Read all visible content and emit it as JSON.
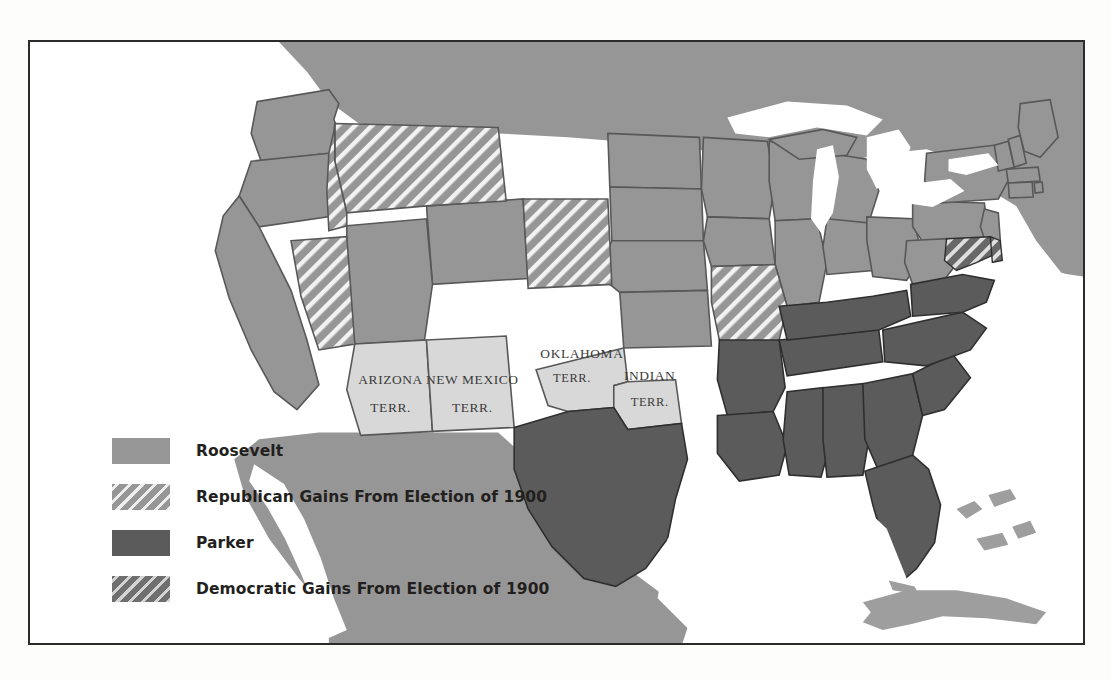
{
  "figure": {
    "kind": "historical-election-map",
    "region": "United States",
    "frame_border_color": "#2b2b2b",
    "background_color": "#ffffff"
  },
  "colors": {
    "roosevelt": "#969696",
    "parker": "#5b5b5b",
    "republican_gain_base": "#969696",
    "republican_gain_hatch": "#f5f5f5",
    "democratic_gain_base": "#6f6f6f",
    "democratic_gain_hatch": "#e1e1e1",
    "territory": "#d8d8d8",
    "water": "#ffffff",
    "outline": "#4a4a4a",
    "state_border": "#585858",
    "text": "#231f1d"
  },
  "legend": {
    "items": [
      {
        "label": "Roosevelt",
        "swatch": "roosevelt",
        "pattern": "solid"
      },
      {
        "label": "Republican Gains From Election of 1900",
        "swatch": "republican-gain",
        "pattern": "hatch"
      },
      {
        "label": "Parker",
        "swatch": "parker",
        "pattern": "solid"
      },
      {
        "label": "Democratic Gains From Election of 1900",
        "swatch": "democratic-gain",
        "pattern": "hatch"
      }
    ]
  },
  "territory_labels": [
    {
      "line1": "ARIZONA",
      "line2": "TERR."
    },
    {
      "line1": "NEW MEXICO",
      "line2": "TERR."
    },
    {
      "line1": "OKLAHOMA",
      "line2": "TERR."
    },
    {
      "line1": "INDIAN",
      "line2": "TERR."
    }
  ],
  "map_content": {
    "type": "choropleth",
    "election_year": 1904,
    "candidates": [
      "Roosevelt",
      "Parker"
    ],
    "categories": [
      "Roosevelt",
      "Republican Gains From Election of 1900",
      "Parker",
      "Democratic Gains From Election of 1900"
    ],
    "regions": [
      {
        "name": "Washington",
        "category": "Roosevelt"
      },
      {
        "name": "Oregon",
        "category": "Roosevelt"
      },
      {
        "name": "California",
        "category": "Roosevelt"
      },
      {
        "name": "Idaho",
        "category": "Republican Gains From Election of 1900"
      },
      {
        "name": "Nevada",
        "category": "Republican Gains From Election of 1900"
      },
      {
        "name": "Montana",
        "category": "Republican Gains From Election of 1900"
      },
      {
        "name": "Wyoming",
        "category": "Roosevelt"
      },
      {
        "name": "Utah",
        "category": "Roosevelt"
      },
      {
        "name": "Colorado",
        "category": "Republican Gains From Election of 1900"
      },
      {
        "name": "North Dakota",
        "category": "Roosevelt"
      },
      {
        "name": "South Dakota",
        "category": "Roosevelt"
      },
      {
        "name": "Nebraska",
        "category": "Roosevelt"
      },
      {
        "name": "Kansas",
        "category": "Roosevelt"
      },
      {
        "name": "Minnesota",
        "category": "Roosevelt"
      },
      {
        "name": "Iowa",
        "category": "Roosevelt"
      },
      {
        "name": "Missouri",
        "category": "Republican Gains From Election of 1900"
      },
      {
        "name": "Wisconsin",
        "category": "Roosevelt"
      },
      {
        "name": "Illinois",
        "category": "Roosevelt"
      },
      {
        "name": "Michigan",
        "category": "Roosevelt"
      },
      {
        "name": "Indiana",
        "category": "Roosevelt"
      },
      {
        "name": "Ohio",
        "category": "Roosevelt"
      },
      {
        "name": "Kentucky",
        "category": "Parker"
      },
      {
        "name": "Tennessee",
        "category": "Parker"
      },
      {
        "name": "Arkansas",
        "category": "Parker"
      },
      {
        "name": "Louisiana",
        "category": "Parker"
      },
      {
        "name": "Mississippi",
        "category": "Parker"
      },
      {
        "name": "Alabama",
        "category": "Parker"
      },
      {
        "name": "Georgia",
        "category": "Parker"
      },
      {
        "name": "Florida",
        "category": "Parker"
      },
      {
        "name": "South Carolina",
        "category": "Parker"
      },
      {
        "name": "North Carolina",
        "category": "Parker"
      },
      {
        "name": "Virginia",
        "category": "Parker"
      },
      {
        "name": "West Virginia",
        "category": "Roosevelt"
      },
      {
        "name": "Maryland",
        "category": "Democratic Gains From Election of 1900"
      },
      {
        "name": "Delaware",
        "category": "Democratic Gains From Election of 1900"
      },
      {
        "name": "Pennsylvania",
        "category": "Roosevelt"
      },
      {
        "name": "New Jersey",
        "category": "Roosevelt"
      },
      {
        "name": "New York",
        "category": "Roosevelt"
      },
      {
        "name": "Connecticut",
        "category": "Roosevelt"
      },
      {
        "name": "Rhode Island",
        "category": "Roosevelt"
      },
      {
        "name": "Massachusetts",
        "category": "Roosevelt"
      },
      {
        "name": "Vermont",
        "category": "Roosevelt"
      },
      {
        "name": "New Hampshire",
        "category": "Roosevelt"
      },
      {
        "name": "Maine",
        "category": "Roosevelt"
      },
      {
        "name": "Texas",
        "category": "Parker"
      },
      {
        "name": "Arizona Terr.",
        "category": "Territory"
      },
      {
        "name": "New Mexico Terr.",
        "category": "Territory"
      },
      {
        "name": "Oklahoma Terr.",
        "category": "Territory"
      },
      {
        "name": "Indian Terr.",
        "category": "Territory"
      }
    ]
  }
}
